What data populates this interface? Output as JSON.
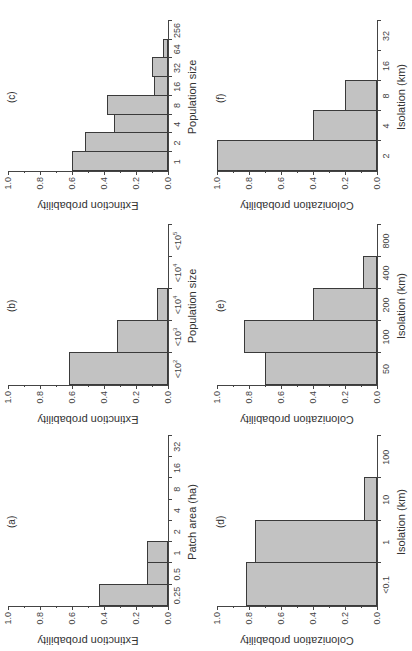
{
  "chart_data": [
    {
      "type": "bar",
      "panel": "(a)",
      "categories": [
        "0.25",
        "0.5",
        "1",
        "2",
        "4",
        "8",
        "16",
        "32"
      ],
      "values": [
        0.43,
        0.13,
        0.13,
        0,
        0,
        0,
        0,
        0
      ],
      "xlabel": "Patch area (ha)",
      "ylabel": "Extinction probability",
      "ylim": [
        0,
        1.0
      ],
      "yticks": [
        "0.0",
        "0.2",
        "0.4",
        "0.6",
        "0.8",
        "1.0"
      ]
    },
    {
      "type": "bar",
      "panel": "(b)",
      "categories": [
        "<10^2",
        "<10^3",
        "<10^4",
        "<10^4",
        "<10^5"
      ],
      "values": [
        0.62,
        0.32,
        0.07,
        0,
        0
      ],
      "xlabel": "Population size",
      "ylabel": "Extinction probability",
      "ylim": [
        0,
        1.0
      ],
      "yticks": [
        "0.0",
        "0.2",
        "0.4",
        "0.6",
        "0.8",
        "1.0"
      ]
    },
    {
      "type": "bar",
      "panel": "(c)",
      "categories": [
        "1",
        "2",
        "4",
        "8",
        "16",
        "32",
        "64",
        "256"
      ],
      "values": [
        0.6,
        0.52,
        0.34,
        0.38,
        0.09,
        0.1,
        0.03,
        0
      ],
      "xlabel": "Population size",
      "ylabel": "Extinction probability",
      "ylim": [
        0,
        1.0
      ],
      "yticks": [
        "0.0",
        "0.2",
        "0.4",
        "0.6",
        "0.8",
        "1.0"
      ]
    },
    {
      "type": "bar",
      "panel": "(d)",
      "categories": [
        "<0.1",
        "1",
        "10",
        "100"
      ],
      "values": [
        0.82,
        0.76,
        0.08,
        0
      ],
      "xlabel": "Isolation (km)",
      "ylabel": "Colonization probability",
      "ylim": [
        0,
        1.0
      ],
      "yticks": [
        "0.0",
        "0.2",
        "0.4",
        "0.6",
        "0.8",
        "1.0"
      ]
    },
    {
      "type": "bar",
      "panel": "(e)",
      "categories": [
        "50",
        "100",
        "200",
        "400",
        "800"
      ],
      "values": [
        0.7,
        0.83,
        0.4,
        0.09,
        0
      ],
      "xlabel": "Isolation (km)",
      "ylabel": "Colonization probability",
      "ylim": [
        0,
        1.0
      ],
      "yticks": [
        "0.0",
        "0.2",
        "0.4",
        "0.6",
        "0.8",
        "1.0"
      ]
    },
    {
      "type": "bar",
      "panel": "(f)",
      "categories": [
        "2",
        "4",
        "8",
        "16",
        "32"
      ],
      "values": [
        1.0,
        0.4,
        0.2,
        0,
        0
      ],
      "xlabel": "Isolation (km)",
      "ylabel": "Colonization probability",
      "ylim": [
        0,
        1.0
      ],
      "yticks": [
        "0.0",
        "0.2",
        "0.4",
        "0.6",
        "0.8",
        "1.0"
      ]
    }
  ],
  "colors": {
    "bar_fill": "#c2c2c2",
    "bar_stroke": "#3a3a3a",
    "axis": "#444444"
  },
  "layout": {
    "orientation": "rotated 90deg counter-clockwise",
    "grid": "2 rows x 3 columns (upright)",
    "panels": [
      {
        "id": "a",
        "left": 44,
        "top": 8,
        "width": 170,
        "height": 160
      },
      {
        "id": "b",
        "left": 265,
        "top": 8,
        "width": 160,
        "height": 160
      },
      {
        "id": "c",
        "left": 479,
        "top": 8,
        "width": 150,
        "height": 160
      },
      {
        "id": "d",
        "left": 44,
        "top": 217,
        "width": 170,
        "height": 160
      },
      {
        "id": "e",
        "left": 265,
        "top": 217,
        "width": 160,
        "height": 160
      },
      {
        "id": "f",
        "left": 479,
        "top": 217,
        "width": 150,
        "height": 160
      }
    ]
  }
}
